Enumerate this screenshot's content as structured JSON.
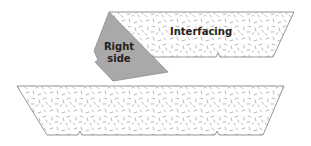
{
  "diagram": {
    "interfacing_piece": {
      "label": "Interfacing",
      "fill": "#ffffff",
      "stroke": "#8a8a8a",
      "speckle_color": "#9a9a9a",
      "notches": 1
    },
    "fabric_piece": {
      "label_line1": "Right",
      "label_line2": "side",
      "fill": "#a9a9a9",
      "stroke": "#8c8c8c"
    },
    "bottom_piece": {
      "fill": "#ffffff",
      "stroke": "#8a8a8a",
      "speckle_color": "#9a9a9a",
      "notches": 2
    }
  }
}
